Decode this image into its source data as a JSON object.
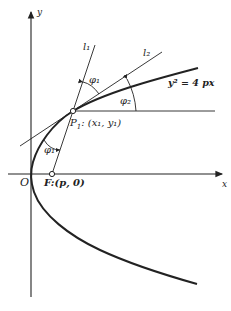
{
  "diagram": {
    "axes": {
      "x_label": "x",
      "y_label": "y",
      "origin_label": "O"
    },
    "curve": {
      "equation": "y² = 4 px",
      "type": "parabola"
    },
    "points": {
      "focus": {
        "label": "F:(p, 0)"
      },
      "p1": {
        "label_main": "P",
        "label_sub": "1",
        "label_coords": ": (x₁, y₁)"
      }
    },
    "lines": {
      "l1": "l₁",
      "l2": "l₂"
    },
    "angles": {
      "phi1_top": "φ₁",
      "phi2": "φ₂",
      "phi1_bottom": "φ₁"
    },
    "colors": {
      "ink": "#222222",
      "background": "#ffffff"
    }
  }
}
